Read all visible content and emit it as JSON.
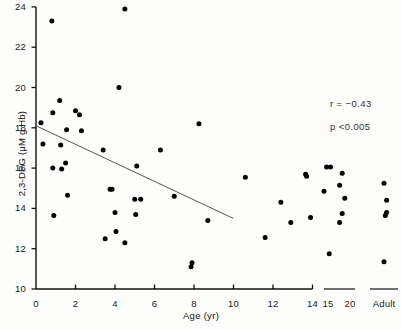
{
  "figure": {
    "width": 402,
    "height": 330,
    "background": "#fdfdfc",
    "ink_color": "#111111",
    "point_color": "#000000"
  },
  "annotations": {
    "correlation": "r =  −0.43",
    "pvalue": "p <0.005"
  },
  "chart_data": {
    "type": "scatter",
    "title": "",
    "xlabel": "Age (yr)",
    "ylabel": "2,3-DPG (μM g Hb)",
    "xlim": [
      0,
      14
    ],
    "ylim": [
      10,
      24
    ],
    "grid": false,
    "legend": null,
    "xticks": [
      0,
      2,
      4,
      6,
      8,
      10,
      12,
      14
    ],
    "xtick_labels": [
      "0",
      "2",
      "4",
      "6",
      "8",
      "10",
      "12",
      "14"
    ],
    "extra_xtick_labels": [
      "15",
      "20",
      "Adult"
    ],
    "yticks": [
      10,
      12,
      14,
      16,
      18,
      20,
      22,
      24
    ],
    "ytick_labels": [
      "10",
      "12",
      "14",
      "16",
      "18",
      "20",
      "22",
      "24"
    ],
    "annotations": [
      "r =  −0.43",
      "p <0.005"
    ],
    "regression_line": {
      "x": [
        0.0,
        10.0
      ],
      "y": [
        18.1,
        13.5
      ],
      "slope": -0.46,
      "intercept": 18.1
    },
    "series": [
      {
        "name": "2,3-DPG vs Age",
        "marker": "filled-circle",
        "color": "#000000",
        "points": [
          [
            0.25,
            18.25
          ],
          [
            0.35,
            17.2
          ],
          [
            0.8,
            23.3
          ],
          [
            0.85,
            18.75
          ],
          [
            0.85,
            16.0
          ],
          [
            0.9,
            13.65
          ],
          [
            1.2,
            19.35
          ],
          [
            1.25,
            17.15
          ],
          [
            1.3,
            15.95
          ],
          [
            1.5,
            16.25
          ],
          [
            1.55,
            17.9
          ],
          [
            1.6,
            14.65
          ],
          [
            2.0,
            18.85
          ],
          [
            2.2,
            18.65
          ],
          [
            2.3,
            17.85
          ],
          [
            3.4,
            16.9
          ],
          [
            3.5,
            12.5
          ],
          [
            3.75,
            14.95
          ],
          [
            3.85,
            14.95
          ],
          [
            4.0,
            13.8
          ],
          [
            4.05,
            12.85
          ],
          [
            4.2,
            20.0
          ],
          [
            4.5,
            23.9
          ],
          [
            4.5,
            12.3
          ],
          [
            5.0,
            14.45
          ],
          [
            5.05,
            13.7
          ],
          [
            5.3,
            14.45
          ],
          [
            5.1,
            16.1
          ],
          [
            6.3,
            16.9
          ],
          [
            7.0,
            14.6
          ],
          [
            7.85,
            11.1
          ],
          [
            7.9,
            11.3
          ],
          [
            8.25,
            18.2
          ],
          [
            8.7,
            13.4
          ],
          [
            10.6,
            15.55
          ],
          [
            11.6,
            12.55
          ],
          [
            12.4,
            14.3
          ],
          [
            12.9,
            13.3
          ],
          [
            13.65,
            15.7
          ],
          [
            13.7,
            15.6
          ],
          [
            13.9,
            13.55
          ],
          [
            15.1,
            16.05
          ],
          [
            15.25,
            16.05
          ],
          [
            15.0,
            14.85
          ],
          [
            15.2,
            11.75
          ],
          [
            15.7,
            15.75
          ],
          [
            15.6,
            15.15
          ],
          [
            15.8,
            14.5
          ],
          [
            15.7,
            13.75
          ],
          [
            15.6,
            13.3
          ],
          [
            16.5,
            15.25
          ],
          [
            16.6,
            14.4
          ],
          [
            16.6,
            13.8
          ],
          [
            16.55,
            13.65
          ],
          [
            16.5,
            11.35
          ]
        ]
      }
    ]
  }
}
